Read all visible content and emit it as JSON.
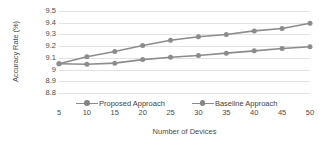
{
  "chart_data": {
    "type": "line",
    "title": "",
    "xlabel": "Number of Devices",
    "ylabel": "Accuracy Rate (%)",
    "x": [
      5,
      10,
      15,
      20,
      25,
      30,
      35,
      40,
      45,
      50
    ],
    "xtick_labels": [
      "5",
      "10",
      "15",
      "20",
      "25",
      "30",
      "35",
      "40",
      "45",
      "50"
    ],
    "ytick_labels": [
      "9.5",
      "9.4",
      "9.3",
      "9.2",
      "9.1",
      "9",
      "8.9",
      "8.8"
    ],
    "ytick_values": [
      9.5,
      9.4,
      9.3,
      9.2,
      9.1,
      9.0,
      8.9,
      8.8
    ],
    "ylim": [
      8.8,
      9.5
    ],
    "xlim": [
      5,
      50
    ],
    "grid": true,
    "grid_axis": "y",
    "legend_position": "bottom",
    "series": [
      {
        "name": "Proposed Approach",
        "color": "#8c8c8e",
        "marker": "circle",
        "values": [
          9.05,
          9.11,
          9.155,
          9.205,
          9.25,
          9.28,
          9.3,
          9.33,
          9.35,
          9.395
        ]
      },
      {
        "name": "Baseline Approach",
        "color": "#8c8c8e",
        "marker": "circle",
        "values": [
          9.05,
          9.045,
          9.055,
          9.085,
          9.105,
          9.12,
          9.14,
          9.16,
          9.18,
          9.195
        ]
      }
    ]
  },
  "axes": {
    "y_title": "Accuracy Rate (%)",
    "x_title": "Number of Devices"
  },
  "legend": {
    "items": [
      {
        "label": "Proposed Approach"
      },
      {
        "label": "Baseline Approach"
      }
    ]
  },
  "colors": {
    "line": "#8c8c8e",
    "marker": "#858587",
    "grid": "#e2e2e2",
    "text": "#4c4c4e",
    "background": "#ffffff"
  }
}
